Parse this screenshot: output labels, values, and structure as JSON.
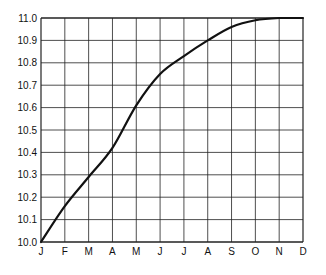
{
  "chart_data": {
    "type": "line",
    "title": "",
    "xlabel": "",
    "ylabel": "",
    "categories": [
      "J",
      "F",
      "M",
      "A",
      "M",
      "J",
      "J",
      "A",
      "S",
      "O",
      "N",
      "D"
    ],
    "series": [
      {
        "name": "",
        "values": [
          10.0,
          10.16,
          10.29,
          10.42,
          10.61,
          10.75,
          10.83,
          10.9,
          10.96,
          10.99,
          11.0,
          11.0
        ]
      }
    ],
    "ylim": [
      10.0,
      11.0
    ],
    "yticks": [
      "10.0",
      "10.1",
      "10.2",
      "10.3",
      "10.4",
      "10.5",
      "10.6",
      "10.7",
      "10.8",
      "10.9",
      "11.0"
    ],
    "grid": true,
    "legend": null
  },
  "style": {
    "line_color": "#111111",
    "grid_color": "#222222",
    "background": "#ffffff"
  }
}
